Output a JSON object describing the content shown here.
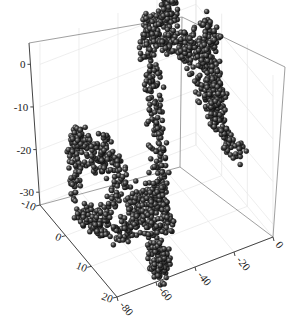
{
  "chart_data": {
    "type": "scatter",
    "subtype": "3d-scatter-spheres",
    "title": "",
    "xlabel": "",
    "ylabel": "",
    "zlabel": "",
    "x_axis": {
      "ticks": [
        -80,
        -60,
        -40,
        -20,
        0
      ],
      "range": [
        -80,
        0
      ]
    },
    "y_axis": {
      "ticks": [
        -10,
        0,
        10,
        20
      ],
      "range": [
        -10,
        20
      ]
    },
    "z_axis": {
      "ticks": [
        0,
        -10,
        -20,
        -30
      ],
      "range": [
        -33,
        5
      ]
    },
    "grid": true,
    "legend": null,
    "marker": {
      "shape": "sphere",
      "color": "#3a3a3a",
      "highlight": "#9a9a9a"
    },
    "series": [
      {
        "name": "chain",
        "description": "Approximation traced by eye from the visible chain shape; not the figure's underlying data. Densely packed spheres forming a random-walk polymer with two large blobs joined by a thin strand.",
        "points": [
          {
            "x": -78,
            "y": 2,
            "z": -22
          },
          {
            "x": -74,
            "y": 0,
            "z": -14
          },
          {
            "x": -70,
            "y": -2,
            "z": -12
          },
          {
            "x": -66,
            "y": 4,
            "z": -17
          },
          {
            "x": -62,
            "y": 1,
            "z": -13
          },
          {
            "x": -58,
            "y": 6,
            "z": -20
          },
          {
            "x": -72,
            "y": 8,
            "z": -25
          },
          {
            "x": -80,
            "y": 6,
            "z": -24
          },
          {
            "x": -68,
            "y": 10,
            "z": -27
          },
          {
            "x": -60,
            "y": 12,
            "z": -26
          },
          {
            "x": -56,
            "y": 9,
            "z": -21
          },
          {
            "x": -52,
            "y": 14,
            "z": -30
          },
          {
            "x": -54,
            "y": 16,
            "z": -35
          },
          {
            "x": -48,
            "y": 15,
            "z": -33
          },
          {
            "x": -50,
            "y": 10,
            "z": -24
          },
          {
            "x": -46,
            "y": 8,
            "z": -22
          },
          {
            "x": -44,
            "y": 12,
            "z": -28
          },
          {
            "x": -40,
            "y": 6,
            "z": -20
          },
          {
            "x": -36,
            "y": 2,
            "z": -14
          },
          {
            "x": -32,
            "y": -2,
            "z": -8
          },
          {
            "x": -30,
            "y": -6,
            "z": -2
          },
          {
            "x": -26,
            "y": -8,
            "z": 2
          },
          {
            "x": -22,
            "y": -4,
            "z": -2
          },
          {
            "x": -18,
            "y": -8,
            "z": 6
          },
          {
            "x": -14,
            "y": -10,
            "z": 10
          },
          {
            "x": -20,
            "y": -6,
            "z": 4
          },
          {
            "x": -16,
            "y": -2,
            "z": -4
          },
          {
            "x": -10,
            "y": -4,
            "z": -2
          },
          {
            "x": -6,
            "y": 0,
            "z": -8
          },
          {
            "x": -4,
            "y": 2,
            "z": -12
          },
          {
            "x": -8,
            "y": 4,
            "z": -16
          },
          {
            "x": -2,
            "y": -2,
            "z": -4
          },
          {
            "x": 2,
            "y": -6,
            "z": -2
          },
          {
            "x": -12,
            "y": 0,
            "z": -10
          },
          {
            "x": -6,
            "y": 6,
            "z": -18
          },
          {
            "x": -2,
            "y": 8,
            "z": -22
          }
        ]
      }
    ]
  }
}
